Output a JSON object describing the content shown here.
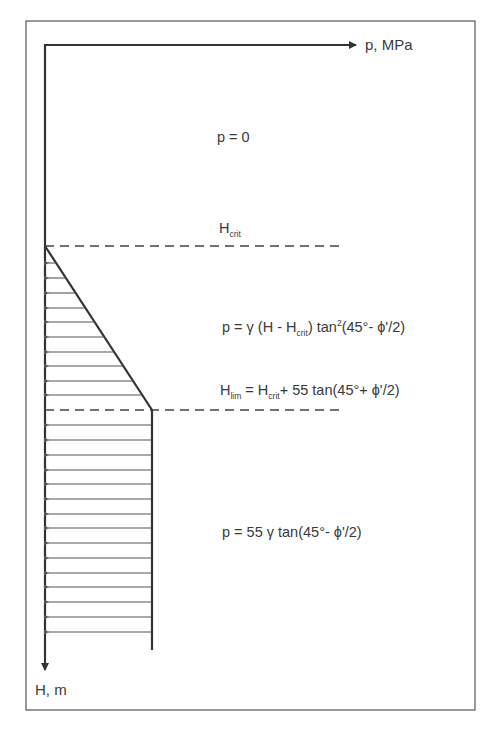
{
  "diagram": {
    "axes": {
      "x_label": "p, MPa",
      "y_label": "H, m"
    },
    "zones": [
      {
        "name": "above-critical",
        "formula": "p = 0"
      },
      {
        "name": "transition",
        "formula_parts": [
          "p = γ (H - H",
          "crit",
          ") tan",
          "2",
          "(45°- ϕ'/2)"
        ]
      },
      {
        "name": "limit",
        "formula_parts": [
          "p = 55 γ tan(45°- ϕ'/2)"
        ]
      }
    ],
    "levels": [
      {
        "name": "H_crit",
        "main": "H",
        "sub": "crit"
      },
      {
        "name": "H_lim",
        "parts": [
          "H",
          "lim",
          " = H",
          "crit",
          "+ 55 tan(45°+ ϕ'/2)"
        ]
      }
    ],
    "colors": {
      "line": "#333333",
      "frame": "#555555",
      "hatch": "#555555",
      "background": "#ffffff"
    }
  }
}
